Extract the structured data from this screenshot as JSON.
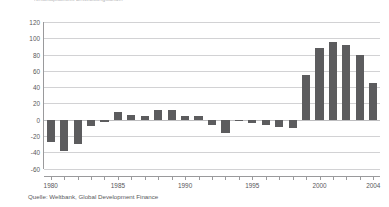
{
  "figure": {
    "clipped_title": "Nettokapitalfluss Entwicklungsländer",
    "source_note": "Quelle: Weltbank, Global Development Finance"
  },
  "chart_data": {
    "type": "bar",
    "title": "",
    "xlabel": "",
    "ylabel": "",
    "ylim": [
      -60,
      120
    ],
    "ytick_values": [
      120,
      100,
      80,
      60,
      40,
      20,
      0,
      -20,
      -40,
      -60
    ],
    "ytick_labels": [
      "120",
      "100",
      "80",
      "60",
      "40",
      "20",
      "0",
      "-20",
      "-40",
      "-60"
    ],
    "grid": true,
    "legend": "none",
    "xtick_labeled": [
      "1980",
      "1985",
      "1990",
      "1995",
      "2000",
      "2004"
    ],
    "x_minor_ticks_every_year": true,
    "categories": [
      "1980",
      "1981",
      "1982",
      "1983",
      "1984",
      "1985",
      "1986",
      "1987",
      "1988",
      "1989",
      "1990",
      "1991",
      "1992",
      "1993",
      "1994",
      "1995",
      "1996",
      "1997",
      "1998",
      "1999",
      "2000",
      "2001",
      "2002",
      "2003",
      "2004"
    ],
    "values": [
      -27,
      -38,
      -30,
      -8,
      -3,
      9,
      6,
      5,
      12,
      12,
      4,
      5,
      -6,
      -16,
      -1,
      -4,
      -6,
      -9,
      -10,
      55,
      88,
      96,
      92,
      80,
      45
    ],
    "bar_color": "#5c5c5e",
    "gridline_color": "#d2d2d4",
    "axis_color": "#9a9a9c"
  }
}
